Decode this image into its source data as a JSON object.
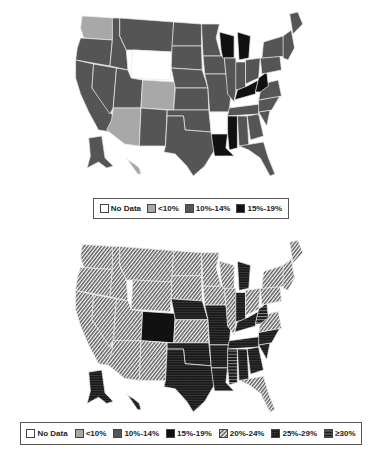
{
  "maps": [
    {
      "id": "top",
      "legend": [
        {
          "label": "No Data",
          "key": "nodata"
        },
        {
          "label": "<10%",
          "key": "lt10"
        },
        {
          "label": "10%-14%",
          "key": "p10_14"
        },
        {
          "label": "15%-19%",
          "key": "p15_19"
        }
      ],
      "state_categories": {
        "WA": "lt10",
        "OR": "p10_14",
        "CA": "p10_14",
        "NV": "p10_14",
        "ID": "p10_14",
        "MT": "p10_14",
        "WY": "nodata",
        "UT": "p10_14",
        "AZ": "lt10",
        "CO": "lt10",
        "NM": "p10_14",
        "ND": "p10_14",
        "SD": "p10_14",
        "NE": "p10_14",
        "KS": "p10_14",
        "OK": "p10_14",
        "TX": "p10_14",
        "MN": "p10_14",
        "IA": "p10_14",
        "MO": "p10_14",
        "AR": "nodata",
        "LA": "p15_19",
        "WI": "p15_19",
        "IL": "p10_14",
        "MI": "p15_19",
        "IN": "p10_14",
        "OH": "p10_14",
        "KY": "p15_19",
        "TN": "p10_14",
        "MS": "p15_19",
        "AL": "p10_14",
        "GA": "p10_14",
        "FL": "p10_14",
        "SC": "p10_14",
        "NC": "p10_14",
        "VA": "p10_14",
        "WV": "p15_19",
        "PA": "p10_14",
        "NY": "p10_14",
        "NE_states": "p10_14",
        "ME": "p10_14",
        "AK": "p10_14",
        "HI": "lt10"
      }
    },
    {
      "id": "bottom",
      "legend": [
        {
          "label": "No Data",
          "key": "nodata"
        },
        {
          "label": "<10%",
          "key": "lt10"
        },
        {
          "label": "10%-14%",
          "key": "p10_14"
        },
        {
          "label": "15%-19%",
          "key": "p15_19"
        },
        {
          "label": "20%-24%",
          "key": "p20_24"
        },
        {
          "label": "25%-29%",
          "key": "p25_29"
        },
        {
          "label": "≥30%",
          "key": "ge30"
        }
      ],
      "state_categories": {
        "WA": "p20_24",
        "OR": "p20_24",
        "CA": "p20_24",
        "NV": "p20_24",
        "ID": "p20_24",
        "MT": "p20_24",
        "WY": "p20_24",
        "UT": "p20_24",
        "AZ": "p20_24",
        "CO": "p15_19",
        "NM": "p20_24",
        "ND": "p20_24",
        "SD": "p20_24",
        "NE": "p25_29",
        "KS": "p20_24",
        "OK": "p25_29",
        "TX": "p25_29",
        "MN": "p20_24",
        "IA": "p20_24",
        "MO": "p25_29",
        "AR": "p25_29",
        "LA": "p25_29",
        "WI": "p20_24",
        "IL": "p20_24",
        "MI": "p25_29",
        "IN": "p25_29",
        "OH": "p20_24",
        "KY": "p25_29",
        "TN": "p25_29",
        "MS": "ge30",
        "AL": "p25_29",
        "GA": "p25_29",
        "FL": "p20_24",
        "SC": "p25_29",
        "NC": "p25_29",
        "VA": "p20_24",
        "WV": "ge30",
        "PA": "p20_24",
        "NY": "p20_24",
        "NE_states": "p20_24",
        "ME": "p20_24",
        "AK": "p25_29",
        "HI": "p25_29"
      }
    }
  ],
  "fills": {
    "nodata": "#ffffff",
    "lt10": "#a8a8a8",
    "p10_14": "#555555",
    "p15_19": "#111111",
    "p20_24": "url(#pat-diag)",
    "p25_29": "url(#pat-dots)",
    "ge30": "url(#pat-horiz)"
  }
}
